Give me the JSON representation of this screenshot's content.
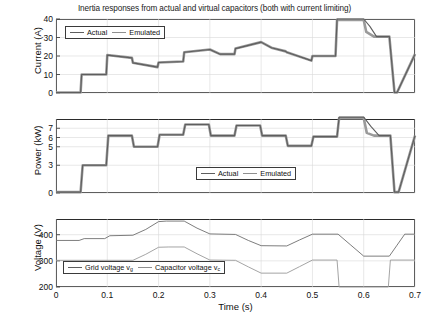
{
  "title": "Inertia responses from actual and virtual capacitors (both with current limiting)",
  "xlabel": "Time (s)",
  "xticks": [
    "0",
    "0.1",
    "0.2",
    "0.3",
    "0.4",
    "0.5",
    "0.6",
    "0.7"
  ],
  "panels": {
    "current": {
      "ylabel": "Current (A)",
      "yticks": [
        "0",
        "10",
        "20",
        "30",
        "40"
      ],
      "legend": [
        "Actual",
        "Emulated"
      ]
    },
    "power": {
      "ylabel": "Power (kW)",
      "yticks": [
        "0",
        "3",
        "5",
        "6",
        "7"
      ],
      "legend": [
        "Actual",
        "Emulated"
      ]
    },
    "voltage": {
      "ylabel": "Voltage (V)",
      "yticks": [
        "200",
        "300",
        "400"
      ],
      "legend": [
        "Grid voltage v",
        "Capacitor voltage v"
      ],
      "legend_sub": [
        "g",
        "c"
      ]
    }
  },
  "colors": {
    "actual": "#5e5e5e",
    "emulated": "#9a9a9a",
    "grid_voltage": "#6e6e6e",
    "capacitor_voltage": "#9a9a9a",
    "axis": "#2b2b2b",
    "gridline": "#d8d8d8"
  },
  "chart_data": [
    {
      "type": "line",
      "id": "current",
      "title": "Inertia responses from actual and virtual capacitors (both with current limiting)",
      "xlabel": "Time (s)",
      "ylabel": "Current (A)",
      "xlim": [
        0,
        0.7
      ],
      "ylim": [
        0,
        40
      ],
      "yticks": [
        0,
        10,
        20,
        30,
        40
      ],
      "xticks": [
        0,
        0.1,
        0.2,
        0.3,
        0.4,
        0.5,
        0.6,
        0.7
      ],
      "grid": true,
      "legend_position": "upper-left",
      "series": [
        {
          "name": "Actual",
          "x": [
            0,
            0.048,
            0.05,
            0.098,
            0.1,
            0.148,
            0.15,
            0.198,
            0.2,
            0.248,
            0.25,
            0.3,
            0.32,
            0.348,
            0.35,
            0.4,
            0.42,
            0.448,
            0.45,
            0.498,
            0.5,
            0.545,
            0.548,
            0.55,
            0.6,
            0.605,
            0.62,
            0.648,
            0.65,
            0.66,
            0.665,
            0.7
          ],
          "y": [
            0.3,
            0.3,
            10.0,
            10.0,
            20.5,
            19.0,
            16.3,
            14.0,
            16.5,
            17.0,
            22.0,
            23.5,
            21.0,
            21.0,
            24.0,
            27.5,
            24.5,
            22.5,
            22.0,
            17.5,
            20.0,
            20.0,
            39.5,
            39.5,
            39.5,
            33.0,
            30.5,
            30.5,
            30.5,
            0.3,
            0.3,
            21.0
          ]
        },
        {
          "name": "Emulated",
          "x": [
            0,
            0.048,
            0.05,
            0.098,
            0.1,
            0.148,
            0.15,
            0.198,
            0.2,
            0.248,
            0.25,
            0.3,
            0.32,
            0.348,
            0.35,
            0.4,
            0.42,
            0.448,
            0.45,
            0.498,
            0.5,
            0.545,
            0.548,
            0.55,
            0.6,
            0.612,
            0.625,
            0.648,
            0.65,
            0.66,
            0.665,
            0.7
          ],
          "y": [
            0.3,
            0.3,
            10.0,
            10.0,
            20.5,
            19.0,
            16.3,
            14.0,
            16.5,
            17.0,
            22.0,
            23.5,
            21.0,
            21.0,
            24.0,
            27.5,
            24.5,
            22.5,
            22.0,
            17.5,
            20.0,
            20.0,
            40.0,
            40.0,
            40.0,
            36.0,
            30.5,
            30.5,
            30.5,
            0.3,
            0.3,
            21.0
          ]
        }
      ]
    },
    {
      "type": "line",
      "id": "power",
      "xlabel": "Time (s)",
      "ylabel": "Power (kW)",
      "xlim": [
        0,
        0.7
      ],
      "ylim": [
        0,
        8
      ],
      "yticks": [
        0,
        3,
        5,
        6,
        7
      ],
      "xticks": [
        0,
        0.1,
        0.2,
        0.3,
        0.4,
        0.5,
        0.6,
        0.7
      ],
      "grid": true,
      "legend_position": "lower-center",
      "series": [
        {
          "name": "Actual",
          "x": [
            0,
            0.048,
            0.052,
            0.098,
            0.102,
            0.148,
            0.152,
            0.198,
            0.202,
            0.248,
            0.252,
            0.298,
            0.302,
            0.348,
            0.352,
            0.398,
            0.402,
            0.448,
            0.452,
            0.498,
            0.502,
            0.548,
            0.552,
            0.6,
            0.606,
            0.62,
            0.648,
            0.652,
            0.66,
            0.668,
            0.7
          ],
          "y": [
            0.1,
            0.1,
            3.0,
            3.0,
            6.2,
            6.2,
            5.0,
            5.0,
            6.3,
            6.3,
            7.4,
            7.4,
            6.2,
            6.2,
            7.3,
            7.3,
            6.2,
            6.2,
            5.1,
            5.1,
            6.1,
            6.1,
            8.1,
            8.1,
            6.5,
            6.2,
            6.2,
            6.2,
            0.1,
            0.1,
            6.2
          ]
        },
        {
          "name": "Emulated",
          "x": [
            0,
            0.048,
            0.052,
            0.098,
            0.102,
            0.148,
            0.152,
            0.198,
            0.202,
            0.248,
            0.252,
            0.298,
            0.302,
            0.348,
            0.352,
            0.398,
            0.402,
            0.448,
            0.452,
            0.498,
            0.502,
            0.548,
            0.552,
            0.6,
            0.614,
            0.63,
            0.648,
            0.652,
            0.66,
            0.668,
            0.7
          ],
          "y": [
            0.1,
            0.1,
            3.0,
            3.0,
            6.2,
            6.2,
            5.0,
            5.0,
            6.3,
            6.3,
            7.4,
            7.4,
            6.2,
            6.2,
            7.3,
            7.3,
            6.2,
            6.2,
            5.1,
            5.1,
            6.1,
            6.1,
            8.2,
            8.2,
            7.2,
            6.2,
            6.2,
            6.2,
            0.1,
            0.1,
            6.2
          ]
        }
      ]
    },
    {
      "type": "line",
      "id": "voltage",
      "xlabel": "Time (s)",
      "ylabel": "Voltage (V)",
      "xlim": [
        0,
        0.7
      ],
      "ylim": [
        200,
        460
      ],
      "yticks": [
        200,
        300,
        400
      ],
      "xticks": [
        0,
        0.1,
        0.2,
        0.3,
        0.4,
        0.5,
        0.6,
        0.7
      ],
      "grid": true,
      "legend_position": "lower-left",
      "series": [
        {
          "name": "Grid voltage v_g",
          "x": [
            0,
            0.045,
            0.055,
            0.095,
            0.105,
            0.15,
            0.175,
            0.2,
            0.215,
            0.25,
            0.275,
            0.3,
            0.35,
            0.375,
            0.4,
            0.45,
            0.475,
            0.5,
            0.55,
            0.575,
            0.6,
            0.65,
            0.665,
            0.68,
            0.7
          ],
          "y": [
            378,
            378,
            385,
            385,
            396,
            398,
            420,
            450,
            452,
            452,
            425,
            403,
            401,
            378,
            358,
            357,
            380,
            402,
            402,
            360,
            318,
            318,
            360,
            402,
            402
          ]
        },
        {
          "name": "Capacitor voltage v_c",
          "x": [
            0,
            0.15,
            0.175,
            0.2,
            0.22,
            0.25,
            0.275,
            0.3,
            0.35,
            0.375,
            0.4,
            0.45,
            0.475,
            0.5,
            0.548,
            0.552,
            0.648,
            0.652,
            0.7
          ],
          "y": [
            302,
            302,
            325,
            352,
            353,
            353,
            327,
            303,
            302,
            277,
            253,
            253,
            278,
            303,
            303,
            200,
            200,
            303,
            303
          ]
        }
      ]
    }
  ]
}
